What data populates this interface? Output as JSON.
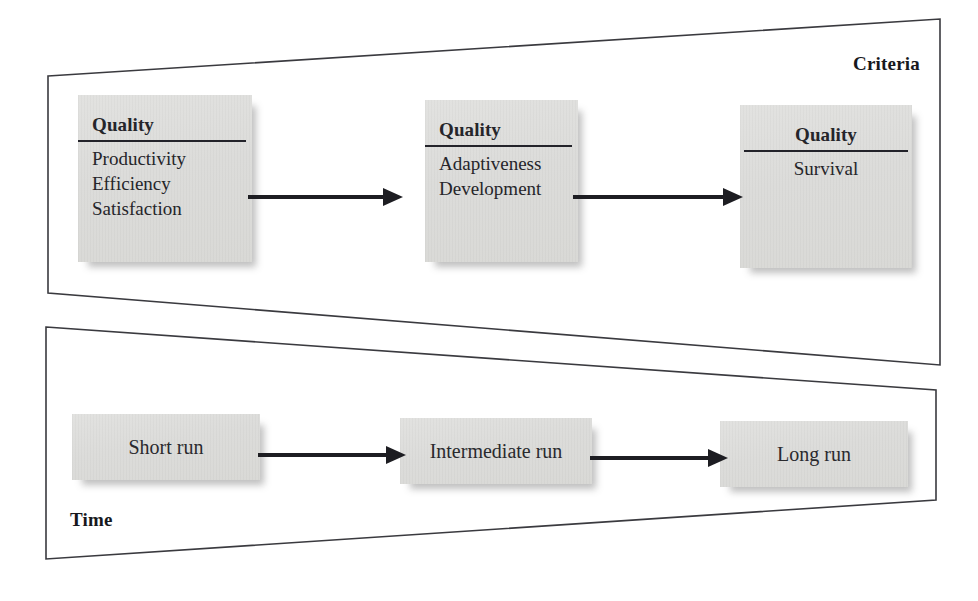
{
  "diagram": {
    "stroke_color": "#3a3a3f",
    "box_fill_color": "#dcdcda",
    "arrow_color": "#1d1d22",
    "background_color": "#ffffff"
  },
  "panels": [
    {
      "id": "criteria",
      "caption": "Criteria",
      "caption_position": "top-right"
    },
    {
      "id": "time",
      "caption": "Time",
      "caption_position": "bottom-left"
    }
  ],
  "criteria_row": {
    "nodes": [
      {
        "id": "quality-short",
        "title": "Quality",
        "items": [
          "Productivity",
          "Efficiency",
          "Satisfaction"
        ],
        "align": "left"
      },
      {
        "id": "quality-intermediate",
        "title": "Quality",
        "items": [
          "Adaptiveness",
          "Development"
        ],
        "align": "left"
      },
      {
        "id": "quality-long",
        "title": "Quality",
        "items": [
          "Survival"
        ],
        "align": "center"
      }
    ],
    "connectors": [
      "arrow-right",
      "arrow-right"
    ]
  },
  "time_row": {
    "nodes": [
      {
        "id": "short-run",
        "label": "Short run"
      },
      {
        "id": "intermediate-run",
        "label": "Intermediate run"
      },
      {
        "id": "long-run",
        "label": "Long run"
      }
    ],
    "connectors": [
      "arrow-right",
      "arrow-right"
    ]
  }
}
